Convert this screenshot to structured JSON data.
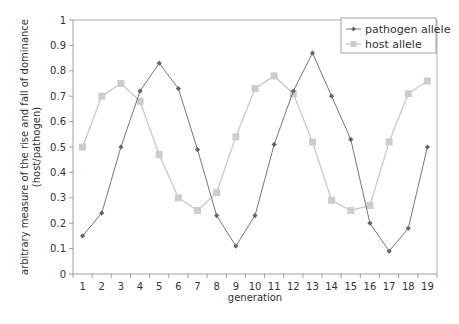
{
  "chart_data": {
    "type": "line",
    "title": "",
    "xlabel": "generation",
    "ylabel": "arbitrary measure of the rise and fall of dominance (host/pathogen)",
    "ylabel_lines": [
      "arbitrary measure of the rise and fall of dominance",
      "(host/pathogen)"
    ],
    "x": [
      1,
      2,
      3,
      4,
      5,
      6,
      7,
      8,
      9,
      10,
      11,
      12,
      13,
      14,
      15,
      16,
      17,
      18,
      19
    ],
    "xlim": [
      0.5,
      19.5
    ],
    "ylim": [
      0,
      1
    ],
    "yticks": [
      0,
      0.1,
      0.2,
      0.3,
      0.4,
      0.5,
      0.6,
      0.7,
      0.8,
      0.9,
      1
    ],
    "ytick_labels": [
      "0",
      "0.1",
      "0.2",
      "0.3",
      "0.4",
      "0.5",
      "0.6",
      "0.7",
      "0.8",
      "0.9",
      "1"
    ],
    "xtick_labels": [
      "1",
      "2",
      "3",
      "4",
      "5",
      "6",
      "7",
      "8",
      "9",
      "10",
      "11",
      "12",
      "13",
      "14",
      "15",
      "16",
      "17",
      "18",
      "19"
    ],
    "grid": false,
    "legend_position": "top-right",
    "series": [
      {
        "name": "pathogen allele",
        "color": "#777777",
        "marker": "diamond",
        "values": [
          0.15,
          0.24,
          0.5,
          0.72,
          0.83,
          0.73,
          0.49,
          0.23,
          0.11,
          0.23,
          0.51,
          0.72,
          0.87,
          0.7,
          0.53,
          0.2,
          0.09,
          0.18,
          0.5
        ]
      },
      {
        "name": "host allele",
        "color": "#cccccc",
        "marker": "square",
        "values": [
          0.5,
          0.7,
          0.75,
          0.68,
          0.47,
          0.3,
          0.25,
          0.32,
          0.54,
          0.73,
          0.78,
          0.71,
          0.52,
          0.29,
          0.25,
          0.27,
          0.52,
          0.71,
          0.76
        ]
      }
    ]
  },
  "legend": {
    "items": [
      {
        "label": "pathogen allele"
      },
      {
        "label": "host allele"
      }
    ]
  }
}
